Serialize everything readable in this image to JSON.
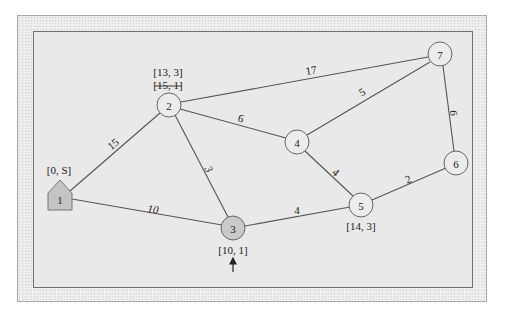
{
  "diagram": {
    "type": "weighted-graph-shortest-path",
    "colors": {
      "outer_frame": "#ececec",
      "inner_panel": "#e9e9e9",
      "panel_border": "#6f6f6f",
      "node_fill": "#ececec",
      "visited_node_fill": "#c9c9c9",
      "source_node_fill": "#c4c4c4",
      "edge": "#555555"
    },
    "nodes": [
      {
        "id": "1",
        "label": "1",
        "x": 60,
        "y": 200,
        "shape": "house",
        "role": "source"
      },
      {
        "id": "2",
        "label": "2",
        "x": 169,
        "y": 105,
        "shape": "circle"
      },
      {
        "id": "3",
        "label": "3",
        "x": 233,
        "y": 228,
        "shape": "circle",
        "role": "current"
      },
      {
        "id": "4",
        "label": "4",
        "x": 297,
        "y": 142,
        "shape": "circle"
      },
      {
        "id": "5",
        "label": "5",
        "x": 361,
        "y": 205,
        "shape": "circle"
      },
      {
        "id": "6",
        "label": "6",
        "x": 456,
        "y": 163,
        "shape": "circle"
      },
      {
        "id": "7",
        "label": "7",
        "x": 440,
        "y": 54,
        "shape": "circle"
      }
    ],
    "edges": [
      {
        "from": "1",
        "to": "2",
        "weight": "15"
      },
      {
        "from": "1",
        "to": "3",
        "weight": "10"
      },
      {
        "from": "2",
        "to": "3",
        "weight": "3"
      },
      {
        "from": "2",
        "to": "4",
        "weight": "6"
      },
      {
        "from": "2",
        "to": "7",
        "weight": "17"
      },
      {
        "from": "3",
        "to": "5",
        "weight": "4"
      },
      {
        "from": "4",
        "to": "5",
        "weight": "4"
      },
      {
        "from": "4",
        "to": "7",
        "weight": "5"
      },
      {
        "from": "5",
        "to": "6",
        "weight": "2"
      },
      {
        "from": "6",
        "to": "7",
        "weight": "6"
      }
    ],
    "node_labels": {
      "node1": "[0, S]",
      "node2_current": "[13, 3]",
      "node2_old": "[15, 1]",
      "node3": "[10, 1]",
      "node5": "[14, 3]"
    },
    "indicator": {
      "type": "up-arrow",
      "target_node": "3"
    }
  }
}
